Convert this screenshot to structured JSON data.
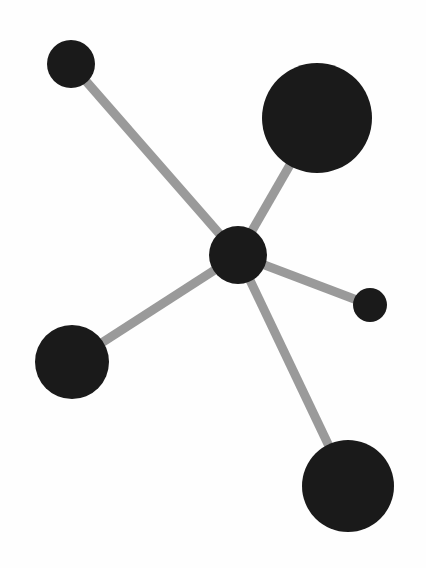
{
  "diagram": {
    "type": "node-link-graph",
    "canvas": {
      "width": 426,
      "height": 568,
      "background_color": "#fefefe"
    },
    "style": {
      "node_fill_color": "#1a1a1a",
      "edge_color": "#9a9a9a",
      "edge_width": 9
    },
    "nodes": [
      {
        "id": "hub",
        "label": "center-hub-node",
        "cx": 238,
        "cy": 255,
        "r": 29,
        "size_class": "medium",
        "degree": 5
      },
      {
        "id": "n-top-left",
        "label": "top-left-node",
        "cx": 71,
        "cy": 64,
        "r": 24,
        "size_class": "small",
        "degree": 1
      },
      {
        "id": "n-top-right",
        "label": "top-right-node",
        "cx": 317,
        "cy": 118,
        "r": 55,
        "size_class": "large",
        "degree": 1
      },
      {
        "id": "n-right",
        "label": "right-small-node",
        "cx": 370,
        "cy": 305,
        "r": 17,
        "size_class": "tiny",
        "degree": 1
      },
      {
        "id": "n-bottom-left",
        "label": "bottom-left-node",
        "cx": 72,
        "cy": 362,
        "r": 37,
        "size_class": "medium-large",
        "degree": 1
      },
      {
        "id": "n-bottom-right",
        "label": "bottom-right-node",
        "cx": 348,
        "cy": 486,
        "r": 46,
        "size_class": "large",
        "degree": 1
      }
    ],
    "edges": [
      {
        "id": "e-hub-topleft",
        "label": "edge-hub-to-top-left",
        "source": "hub",
        "target": "n-top-left",
        "x1": 238,
        "y1": 255,
        "x2": 71,
        "y2": 64,
        "width": 9
      },
      {
        "id": "e-hub-topright",
        "label": "edge-hub-to-top-right",
        "source": "hub",
        "target": "n-top-right",
        "x1": 238,
        "y1": 255,
        "x2": 317,
        "y2": 118,
        "width": 9
      },
      {
        "id": "e-hub-right",
        "label": "edge-hub-to-right",
        "source": "hub",
        "target": "n-right",
        "x1": 238,
        "y1": 255,
        "x2": 370,
        "y2": 305,
        "width": 9
      },
      {
        "id": "e-hub-bottomleft",
        "label": "edge-hub-to-bottom-left",
        "source": "hub",
        "target": "n-bottom-left",
        "x1": 238,
        "y1": 255,
        "x2": 72,
        "y2": 362,
        "width": 9
      },
      {
        "id": "e-hub-bottomright",
        "label": "edge-hub-to-bottom-right",
        "source": "hub",
        "target": "n-bottom-right",
        "x1": 238,
        "y1": 255,
        "x2": 348,
        "y2": 486,
        "width": 9
      }
    ]
  }
}
